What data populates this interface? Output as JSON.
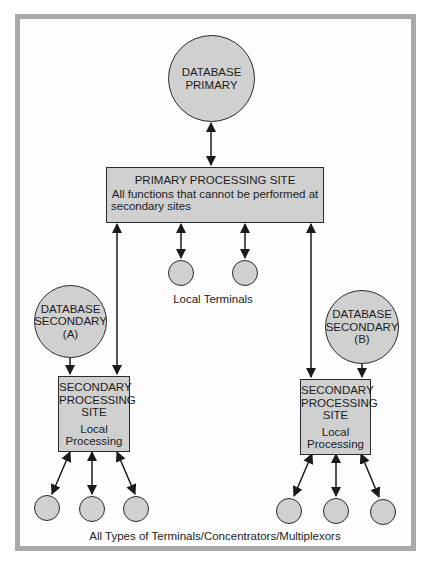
{
  "diagram": {
    "database_primary": {
      "line1": "DATABASE",
      "line2": "PRIMARY"
    },
    "primary_site": {
      "title": "PRIMARY PROCESSING SITE",
      "desc1": "All functions that cannot be performed at",
      "desc2": "secondary sites"
    },
    "local_terminals_label": "Local Terminals",
    "database_secondary_a": {
      "line1": "DATABASE",
      "line2": "SECONDARY",
      "line3": "(A)"
    },
    "database_secondary_b": {
      "line1": "DATABASE",
      "line2": "SECONDARY",
      "line3": "(B)"
    },
    "secondary_site_a": {
      "line1": "SECONDARY",
      "line2": "PROCESSING",
      "line3": "SITE",
      "sub1": "Local",
      "sub2": "Processing"
    },
    "secondary_site_b": {
      "line1": "SECONDARY",
      "line2": "PROCESSING",
      "line3": "SITE",
      "sub1": "Local",
      "sub2": "Processing"
    },
    "bottom_label": "All Types of Terminals/Concentrators/Multiplexors"
  },
  "colors": {
    "node_fill": "#d0d0d0",
    "frame_border": "#a9a9a9",
    "stroke": "#2a2a2a"
  }
}
